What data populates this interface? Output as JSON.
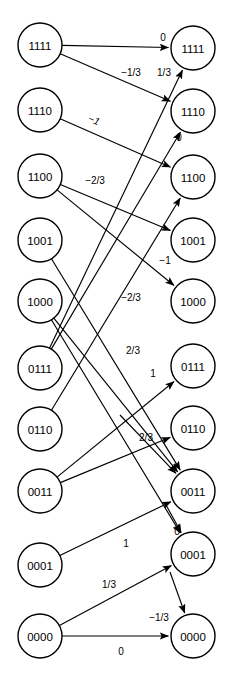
{
  "diagram": {
    "type": "bipartite-transition-graph",
    "width": 233,
    "height": 680,
    "node_radius": 22,
    "colors": {
      "stroke": "#000000",
      "fill": "#ffffff",
      "text": "#000000"
    },
    "left_column": {
      "x": 40,
      "nodes": [
        {
          "id": "L0",
          "label": "1111",
          "y": 45
        },
        {
          "id": "L1",
          "label": "1110",
          "y": 110
        },
        {
          "id": "L2",
          "label": "1100",
          "y": 176
        },
        {
          "id": "L3",
          "label": "1001",
          "y": 240
        },
        {
          "id": "L4",
          "label": "1000",
          "y": 301
        },
        {
          "id": "L5",
          "label": "0111",
          "y": 368
        },
        {
          "id": "L6",
          "label": "0110",
          "y": 429
        },
        {
          "id": "L7",
          "label": "0011",
          "y": 491
        },
        {
          "id": "L8",
          "label": "0001",
          "y": 565
        },
        {
          "id": "L9",
          "label": "0000",
          "y": 636
        }
      ]
    },
    "right_column": {
      "x": 193,
      "nodes": [
        {
          "id": "R0",
          "label": "1111",
          "y": 48
        },
        {
          "id": "R1",
          "label": "1110",
          "y": 111
        },
        {
          "id": "R2",
          "label": "1100",
          "y": 177
        },
        {
          "id": "R3",
          "label": "1001",
          "y": 240
        },
        {
          "id": "R4",
          "label": "1000",
          "y": 301
        },
        {
          "id": "R5",
          "label": "0111",
          "y": 366
        },
        {
          "id": "R6",
          "label": "0110",
          "y": 428
        },
        {
          "id": "R7",
          "label": "0011",
          "y": 491
        },
        {
          "id": "R8",
          "label": "0001",
          "y": 554
        },
        {
          "id": "R9",
          "label": "0000",
          "y": 636
        }
      ]
    },
    "edges": [
      {
        "id": "e0",
        "from": "L0",
        "to": "R0",
        "label": "0",
        "lx": 163,
        "ly": 37,
        "italic": false
      },
      {
        "id": "e1",
        "from": "L0",
        "to": "R1",
        "label": "-1/3",
        "lx": 131,
        "ly": 72,
        "italic": false
      },
      {
        "id": "e2",
        "from": "L1",
        "to": "R2",
        "label": "-1",
        "lx": 94,
        "ly": 120,
        "italic": true
      },
      {
        "id": "e3",
        "from": "L2",
        "to": "R3",
        "label": "-2/3",
        "lx": 95,
        "ly": 180,
        "italic": false
      },
      {
        "id": "e4",
        "from": "L2",
        "to": "R4",
        "label": "-1",
        "lx": 165,
        "ly": 260,
        "italic": false
      },
      {
        "id": "e5",
        "from": "L3",
        "to": "R7",
        "label": "",
        "lx": 0,
        "ly": 0,
        "italic": false
      },
      {
        "id": "e6",
        "from": "L4",
        "to": "R7",
        "label": "-2/3",
        "lx": 131,
        "ly": 297,
        "italic": false
      },
      {
        "id": "e7",
        "from": "L4",
        "to": "R8",
        "label": "",
        "lx": 0,
        "ly": 0,
        "italic": false
      },
      {
        "id": "e8",
        "from": "L5",
        "to": "R0",
        "label": "1/3",
        "lx": 164,
        "ly": 72,
        "italic": false
      },
      {
        "id": "e9",
        "from": "L5",
        "to": "R1",
        "label": "0",
        "lx": 179,
        "ly": 137,
        "italic": false
      },
      {
        "id": "e10",
        "from": "L6",
        "to": "R2",
        "label": "",
        "lx": 0,
        "ly": 0,
        "italic": false
      },
      {
        "id": "e11",
        "from": "L7",
        "to": "R5",
        "label": "1",
        "lx": 153,
        "ly": 373,
        "italic": false
      },
      {
        "id": "e12",
        "from": "L7",
        "to": "R6",
        "label": "2/3",
        "lx": 133,
        "ly": 350,
        "italic": false
      },
      {
        "id": "e13",
        "from": "L8",
        "to": "R7",
        "label": "1",
        "lx": 126,
        "ly": 543,
        "italic": false
      },
      {
        "id": "e14",
        "from": "L9",
        "to": "R8",
        "label": "1/3",
        "lx": 109,
        "ly": 584,
        "italic": false
      },
      {
        "id": "e15",
        "from": "L9",
        "to": "R9",
        "label": "0",
        "lx": 121,
        "ly": 651,
        "italic": false
      },
      {
        "id": "e16",
        "from": "R6_src",
        "to": "R7",
        "label": "2/3",
        "lx": 146,
        "ly": 437,
        "italic": false
      },
      {
        "id": "e17",
        "from": "R7_src",
        "to": "R8",
        "label": "0",
        "lx": 177,
        "ly": 531,
        "italic": false
      },
      {
        "id": "e18",
        "from": "R8_src",
        "to": "R9",
        "label": "-1/3",
        "lx": 159,
        "ly": 617,
        "italic": false
      }
    ]
  }
}
